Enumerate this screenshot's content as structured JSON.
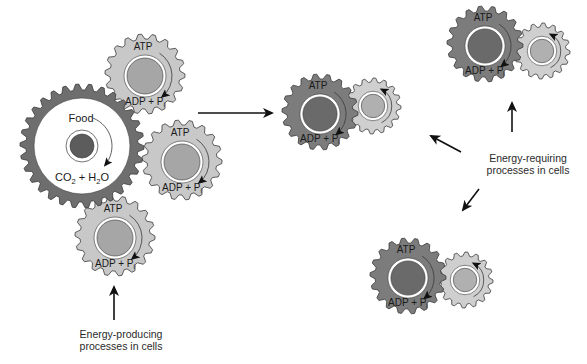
{
  "colors": {
    "background": "#ffffff",
    "food_gear": "#6e6e6e",
    "food_gear_face": "#ffffff",
    "food_core": "#5c5c5c",
    "atp_gear_light": "#c8c8c8",
    "atp_gear_dark": "#7c7c7c",
    "atp_core_light": "#a6a6a6",
    "atp_core_dark": "#6a6a6a",
    "work_gear": "#cfcfcf",
    "work_core": "#b0b0b0",
    "ring": "#ffffff",
    "stroke": "#3a3a3a",
    "arrow": "#111111"
  },
  "food_gear": {
    "cx": 82,
    "cy": 146,
    "r": 62,
    "teeth": 30,
    "top_label": "Food",
    "bottom_label_parts": [
      "CO",
      "2",
      " + H",
      "2",
      "O"
    ]
  },
  "atp_label": "ATP",
  "adp_label": "ADP + P",
  "adp_subscript": "i",
  "producing_gears": [
    {
      "cx": 145,
      "cy": 74,
      "r": 40,
      "teeth": 18
    },
    {
      "cx": 182,
      "cy": 160,
      "r": 40,
      "teeth": 18
    },
    {
      "cx": 115,
      "cy": 236,
      "r": 40,
      "teeth": 18
    }
  ],
  "requiring_pairs": [
    {
      "atp": {
        "cx": 320,
        "cy": 112,
        "r": 38,
        "teeth": 18
      },
      "work": {
        "cx": 373,
        "cy": 106,
        "r": 28,
        "teeth": 16
      }
    },
    {
      "atp": {
        "cx": 485,
        "cy": 44,
        "r": 38,
        "teeth": 18
      },
      "work": {
        "cx": 542,
        "cy": 51,
        "r": 28,
        "teeth": 16
      }
    },
    {
      "atp": {
        "cx": 408,
        "cy": 276,
        "r": 38,
        "teeth": 18
      },
      "work": {
        "cx": 465,
        "cy": 280,
        "r": 28,
        "teeth": 16
      }
    }
  ],
  "arrows": [
    {
      "x1": 198,
      "y1": 113,
      "x2": 272,
      "y2": 113
    },
    {
      "x1": 114,
      "y1": 320,
      "x2": 114,
      "y2": 287
    },
    {
      "x1": 512,
      "y1": 132,
      "x2": 512,
      "y2": 103
    },
    {
      "x1": 461,
      "y1": 152,
      "x2": 431,
      "y2": 136
    },
    {
      "x1": 479,
      "y1": 189,
      "x2": 463,
      "y2": 210
    }
  ],
  "captions": {
    "producing": {
      "line1": "Energy-producing",
      "line2": "processes in cells",
      "x": 121,
      "y": 328
    },
    "requiring": {
      "line1": "Energy-requiring",
      "line2": "processes in cells",
      "x": 528,
      "y": 152
    }
  }
}
